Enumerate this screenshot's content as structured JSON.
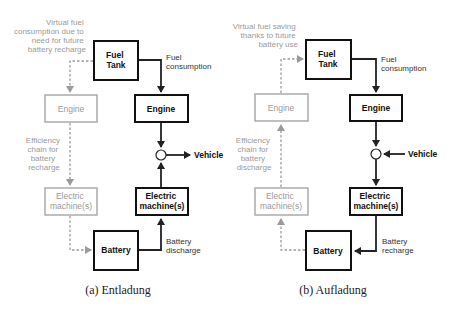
{
  "colors": {
    "active": "#111111",
    "inactive": "#999999",
    "background": "#ffffff"
  },
  "panels": [
    {
      "id": "a",
      "caption": "(a) Entladung",
      "virtual_note": [
        "Virtual fuel",
        "consumption due to",
        "need for future",
        "battery recharge"
      ],
      "efficiency_note": [
        "Efficiency",
        "chain for",
        "battery",
        "recharge"
      ],
      "fuel_tank": [
        "Fuel",
        "Tank"
      ],
      "engine_active": "Engine",
      "engine_virtual": "Engine",
      "em_active": [
        "Electric",
        "machine(s)"
      ],
      "em_virtual": [
        "Electric",
        "machine(s)"
      ],
      "battery": "Battery",
      "fuel_flow_label": [
        "Fuel",
        "consumption"
      ],
      "battery_flow_label": [
        "Battery",
        "discharge"
      ],
      "vehicle": "Vehicle",
      "vehicle_direction": "out"
    },
    {
      "id": "b",
      "caption": "(b) Aufladung",
      "virtual_note": [
        "Virtual fuel saving",
        "thanks  to future",
        "battery use"
      ],
      "efficiency_note": [
        "Efficiency",
        "chain for",
        "battery",
        "discharge"
      ],
      "fuel_tank": [
        "Fuel",
        "Tank"
      ],
      "engine_active": "Engine",
      "engine_virtual": "Engine",
      "em_active": [
        "Electric",
        "machine(s)"
      ],
      "em_virtual": [
        "Electric",
        "machine(s)"
      ],
      "battery": "Battery",
      "fuel_flow_label": [
        "Fuel",
        "consumption"
      ],
      "battery_flow_label": [
        "Battery",
        "recharge"
      ],
      "vehicle": "Vehicle",
      "vehicle_direction": "in"
    }
  ]
}
